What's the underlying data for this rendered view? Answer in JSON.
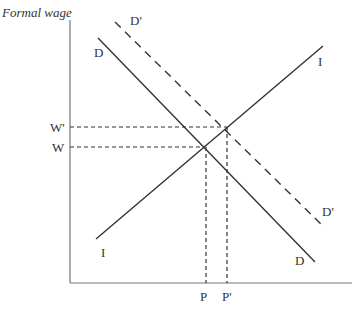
{
  "diagram": {
    "y_axis_label": "Formal wage",
    "curves": {
      "D": {
        "label_start": "D",
        "label_end": "D"
      },
      "D_prime": {
        "label_start": "D'",
        "label_end": "D'"
      },
      "I": {
        "label_start": "I",
        "label_end": "I"
      }
    },
    "y_ticks": {
      "w": "W",
      "w_prime": "W'"
    },
    "x_ticks": {
      "p": "P",
      "p_prime": "P'"
    },
    "colors": {
      "line": "#333333",
      "axis": "#777777"
    }
  }
}
